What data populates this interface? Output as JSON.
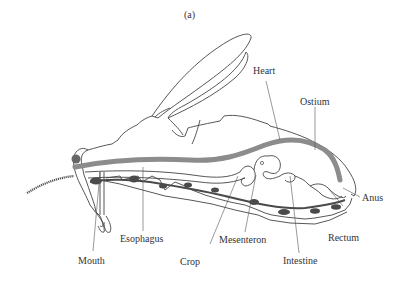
{
  "figure": {
    "panel_label": "(a)"
  },
  "labels": {
    "heart": "Heart",
    "ostium": "Ostium",
    "anus": "Anus",
    "rectum": "Rectum",
    "intestine": "Intestine",
    "mesenteron": "Mesenteron",
    "crop": "Crop",
    "esophagus": "Esophagus",
    "mouth": "Mouth"
  },
  "colors": {
    "outline": "#444444",
    "heart_fill": "#8c8c8c",
    "nerve_cord": "#4a4a4a",
    "background": "#ffffff"
  }
}
